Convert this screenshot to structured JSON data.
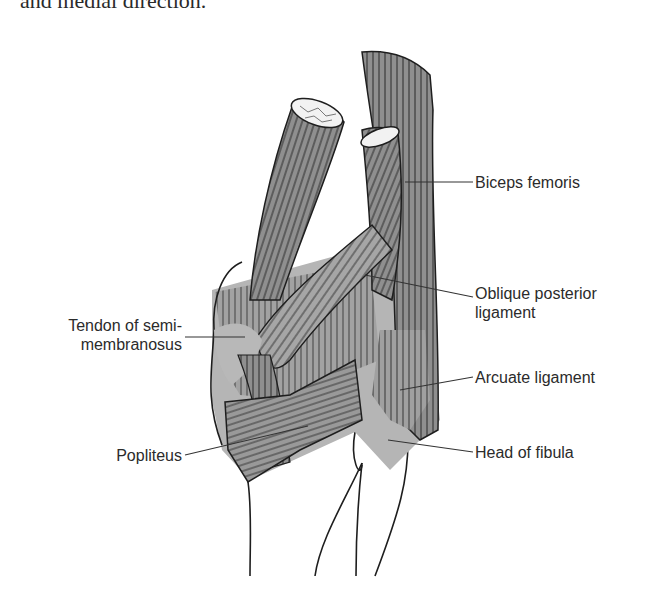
{
  "top_text": "and medial direction.",
  "figure": {
    "colors": {
      "muscle": "#8f8f8f",
      "muscle_light": "#a8a8a8",
      "capsule": "#b5b5b5",
      "outline": "#1e1e1e",
      "leader": "#333333",
      "text": "#2b2b2b"
    },
    "labels": {
      "biceps_femoris": "Biceps femoris",
      "oblique_posterior_ligament_l1": "Oblique posterior",
      "oblique_posterior_ligament_l2": "ligament",
      "tendon_semimembranosus_l1": "Tendon of semi-",
      "tendon_semimembranosus_l2": "membranosus",
      "arcuate_ligament": "Arcuate ligament",
      "popliteus": "Popliteus",
      "head_of_fibula": "Head of fibula"
    }
  }
}
